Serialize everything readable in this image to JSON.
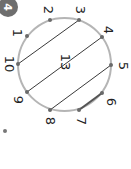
{
  "badge": {
    "label": "4",
    "color": "#6e6e6e"
  },
  "center_label": "13",
  "circle": {
    "color": "#b5b5b5"
  },
  "points": [
    {
      "label": "1",
      "x": 27,
      "y": 36
    },
    {
      "label": "2",
      "x": 50,
      "y": 20
    },
    {
      "label": "3",
      "x": 79,
      "y": 20
    },
    {
      "label": "4",
      "x": 102,
      "y": 37
    },
    {
      "label": "5",
      "x": 111,
      "y": 65
    },
    {
      "label": "6",
      "x": 102,
      "y": 93
    },
    {
      "label": "7",
      "x": 79,
      "y": 110
    },
    {
      "label": "8",
      "x": 50,
      "y": 110
    },
    {
      "label": "9",
      "x": 27,
      "y": 92
    },
    {
      "label": "10",
      "x": 18,
      "y": 64
    }
  ],
  "chords": [
    {
      "from": "10",
      "to": "3"
    },
    {
      "from": "9",
      "to": "4"
    },
    {
      "from": "8",
      "to": "5"
    },
    {
      "from": "7",
      "to": "6"
    }
  ]
}
